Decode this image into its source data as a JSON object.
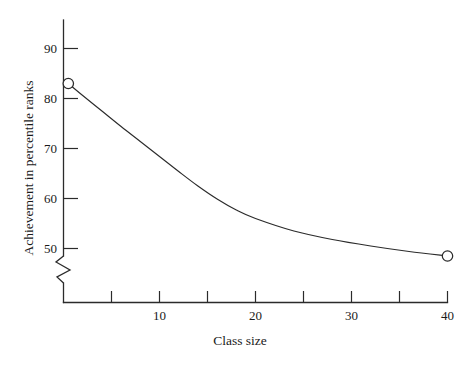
{
  "chart_data": {
    "type": "line",
    "title": "",
    "xlabel": "Class size",
    "ylabel": "Achievement in percentile ranks",
    "xlim": [
      0,
      40
    ],
    "ylim": [
      48,
      92
    ],
    "grid": false,
    "legend": "none",
    "y_axis_break": true,
    "y_axis_break_note": "zigzag break below 50",
    "xticks": [
      0,
      5,
      10,
      15,
      20,
      25,
      30,
      35,
      40
    ],
    "xticklabels": [
      "",
      "",
      "10",
      "",
      "20",
      "",
      "30",
      "",
      "40"
    ],
    "yticks": [
      50,
      60,
      70,
      80,
      90
    ],
    "yticklabels": [
      "50",
      "60",
      "70",
      "80",
      "90"
    ],
    "series": [
      {
        "name": "Achievement",
        "marker": "open-circle",
        "markers_at": [
          0.5,
          40
        ],
        "x": [
          0.5,
          2,
          4,
          6,
          8,
          10,
          12,
          14,
          16,
          18,
          20,
          24,
          28,
          32,
          36,
          40
        ],
        "y": [
          83.0,
          80.6,
          77.5,
          74.4,
          71.4,
          68.4,
          65.4,
          62.5,
          59.9,
          57.7,
          56.0,
          53.5,
          51.8,
          50.5,
          49.4,
          48.5
        ]
      }
    ],
    "annotations": []
  },
  "axis": {
    "x_title": "Class size",
    "y_title": "Achievement in percentile ranks",
    "x_tick_10": "10",
    "x_tick_20": "20",
    "x_tick_30": "30",
    "x_tick_40": "40",
    "y_tick_50": "50",
    "y_tick_60": "60",
    "y_tick_70": "70",
    "y_tick_80": "80",
    "y_tick_90": "90"
  },
  "colors": {
    "line": "#2b2b2b",
    "axis": "#2b2b2b",
    "marker_fill": "#ffffff",
    "background": "#ffffff",
    "text": "#1a1a1a"
  }
}
